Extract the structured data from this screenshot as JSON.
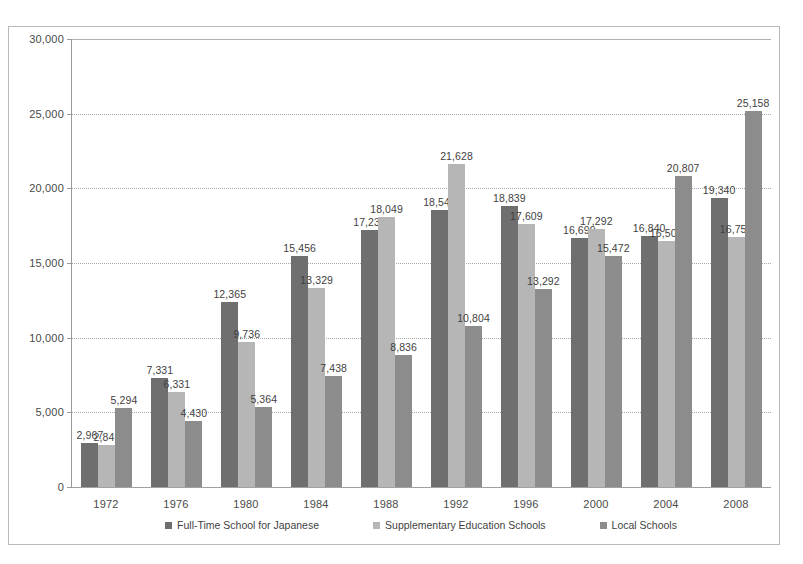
{
  "chart_data": {
    "type": "bar",
    "title": "",
    "subtitle": "",
    "xlabel": "",
    "ylabel": "",
    "categories": [
      "1972",
      "1976",
      "1980",
      "1984",
      "1988",
      "1992",
      "1996",
      "2000",
      "2004",
      "2008"
    ],
    "ylim": [
      0,
      30000
    ],
    "y_ticks": [
      0,
      5000,
      10000,
      15000,
      20000,
      25000,
      30000
    ],
    "y_tick_labels": [
      "0",
      "5,000",
      "10,000",
      "15,000",
      "20,000",
      "25,000",
      "30,000"
    ],
    "grid": true,
    "legend_position": "bottom",
    "series": [
      {
        "name": "Full-Time School for Japanese",
        "color": "#6f6f6f",
        "values": [
          2967,
          7331,
          12365,
          15456,
          17238,
          18545,
          18839,
          16699,
          16840,
          19340
        ],
        "labels": [
          "2,967",
          "7,331",
          "12,365",
          "15,456",
          "17,238",
          "18,545",
          "18,839",
          "16,699",
          "16,840",
          "19,340"
        ]
      },
      {
        "name": "Supplementary Education Schools",
        "color": "#b6b6b6",
        "values": [
          2845,
          6331,
          9736,
          13329,
          18049,
          21628,
          17609,
          17292,
          16501,
          16754
        ],
        "labels": [
          "2,845",
          "6,331",
          "9,736",
          "13,329",
          "18,049",
          "21,628",
          "17,609",
          "17,292",
          "16,501",
          "16,754"
        ]
      },
      {
        "name": "Local Schools",
        "color": "#8c8c8c",
        "values": [
          5294,
          4430,
          5364,
          7438,
          8836,
          10804,
          13292,
          15472,
          20807,
          25158
        ],
        "labels": [
          "5,294",
          "4,430",
          "5,364",
          "7,438",
          "8,836",
          "10,804",
          "13,292",
          "15,472",
          "20,807",
          "25,158"
        ]
      }
    ]
  }
}
